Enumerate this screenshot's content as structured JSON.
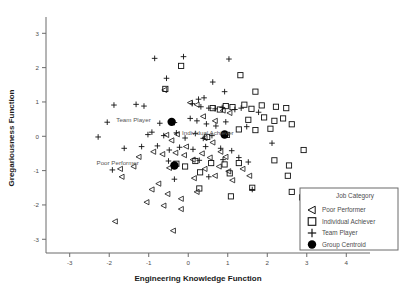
{
  "chart_data": {
    "type": "scatter",
    "title": "",
    "xlabel": "Engineering Knowledge Function",
    "ylabel": "Gregariousness Function",
    "xlim": [
      -3.6,
      4.6
    ],
    "ylim": [
      -3.4,
      3.3
    ],
    "xticks": [
      -3,
      -2,
      -1,
      0,
      1,
      2,
      3,
      4
    ],
    "yticks": [
      -3,
      -2,
      -1,
      0,
      1,
      2,
      3
    ],
    "grid": false,
    "legend": {
      "title": "Job Category",
      "position": "bottom-right",
      "entries": [
        {
          "label": "Poor Performer",
          "marker": "triangle-left"
        },
        {
          "label": "Individual Achiever",
          "marker": "square"
        },
        {
          "label": "Team Player",
          "marker": "plus"
        },
        {
          "label": "Group Centroid",
          "marker": "filled-circle"
        }
      ]
    },
    "annotations": [
      {
        "text": "Team Player",
        "x": -0.95,
        "y": 0.42
      },
      {
        "text": "Individual Achiever",
        "x": 1.15,
        "y": 0.05
      },
      {
        "text": "Poor Performer",
        "x": -1.25,
        "y": -0.85
      }
    ],
    "series": [
      {
        "name": "Team Player",
        "marker": "plus",
        "points": [
          [
            -0.85,
            2.27
          ],
          [
            -0.12,
            2.32
          ],
          [
            1.03,
            2.25
          ],
          [
            -0.55,
            1.69
          ],
          [
            0.62,
            1.58
          ],
          [
            0.92,
            1.3
          ],
          [
            -1.88,
            0.91
          ],
          [
            -1.32,
            0.93
          ],
          [
            -1.12,
            0.88
          ],
          [
            0.26,
            1.08
          ],
          [
            0.4,
            1.12
          ],
          [
            0.1,
            0.95
          ],
          [
            0.32,
            0.86
          ],
          [
            0.52,
            0.82
          ],
          [
            0.68,
            0.8
          ],
          [
            0.86,
            0.84
          ],
          [
            1.18,
            0.78
          ],
          [
            1.34,
            0.82
          ],
          [
            -2.05,
            0.41
          ],
          [
            -0.72,
            0.38
          ],
          [
            -0.35,
            0.4
          ],
          [
            0.05,
            0.52
          ],
          [
            0.22,
            0.45
          ],
          [
            0.46,
            0.36
          ],
          [
            0.7,
            0.3
          ],
          [
            0.95,
            0.42
          ],
          [
            -2.28,
            -0.02
          ],
          [
            -1.02,
            0.05
          ],
          [
            -0.92,
            0.12
          ],
          [
            -0.62,
            0.02
          ],
          [
            -0.3,
            0.1
          ],
          [
            -0.08,
            -0.05
          ],
          [
            0.18,
            0.08
          ],
          [
            0.38,
            -0.06
          ],
          [
            0.6,
            0.02
          ],
          [
            1.48,
            0.28
          ],
          [
            1.78,
            0.7
          ],
          [
            -1.62,
            -0.35
          ],
          [
            -1.18,
            -0.3
          ],
          [
            -0.78,
            -0.28
          ],
          [
            -0.48,
            -0.4
          ],
          [
            -0.22,
            -0.32
          ],
          [
            0.12,
            -0.38
          ],
          [
            0.44,
            -0.3
          ],
          [
            0.82,
            -0.35
          ],
          [
            1.1,
            -0.42
          ],
          [
            -1.92,
            -0.98
          ],
          [
            -0.5,
            -0.72
          ],
          [
            0.28,
            -0.7
          ],
          [
            0.88,
            -0.68
          ],
          [
            1.28,
            -0.62
          ],
          [
            -0.35,
            -1.25
          ],
          [
            0.52,
            -1.18
          ],
          [
            1.62,
            -1.55
          ],
          [
            2.12,
            -0.2
          ],
          [
            1.52,
            -0.75
          ]
        ]
      },
      {
        "name": "Individual Achiever",
        "marker": "square",
        "points": [
          [
            -0.18,
            2.05
          ],
          [
            1.32,
            1.78
          ],
          [
            1.7,
            1.3
          ],
          [
            0.95,
            0.88
          ],
          [
            1.12,
            0.85
          ],
          [
            1.42,
            0.92
          ],
          [
            1.6,
            0.8
          ],
          [
            1.86,
            0.9
          ],
          [
            2.22,
            0.86
          ],
          [
            0.62,
            0.82
          ],
          [
            0.8,
            0.78
          ],
          [
            2.48,
            0.82
          ],
          [
            1.52,
            0.48
          ],
          [
            1.92,
            0.55
          ],
          [
            2.4,
            0.52
          ],
          [
            1.28,
            0.2
          ],
          [
            1.7,
            0.18
          ],
          [
            2.08,
            0.22
          ],
          [
            0.98,
            0.04
          ],
          [
            2.62,
            0.35
          ],
          [
            2.18,
            0.45
          ],
          [
            -0.3,
            -0.8
          ],
          [
            -0.08,
            -0.88
          ],
          [
            0.18,
            -0.72
          ],
          [
            0.58,
            -0.78
          ],
          [
            0.92,
            -0.82
          ],
          [
            1.28,
            -0.78
          ],
          [
            2.18,
            -0.7
          ],
          [
            2.55,
            -0.85
          ],
          [
            0.3,
            -1.05
          ],
          [
            1.05,
            -1.08
          ],
          [
            0.28,
            -1.52
          ],
          [
            1.62,
            -1.5
          ],
          [
            2.62,
            -1.62
          ],
          [
            2.88,
            -1.78
          ],
          [
            -0.58,
            1.38
          ],
          [
            0.48,
            -0.02
          ],
          [
            1.08,
            -1.75
          ],
          [
            2.92,
            -0.4
          ],
          [
            2.52,
            -1.15
          ]
        ]
      },
      {
        "name": "Poor Performer",
        "marker": "triangle-left",
        "points": [
          [
            -0.6,
            1.35
          ],
          [
            0.05,
            0.98
          ],
          [
            0.22,
            0.92
          ],
          [
            0.88,
            0.75
          ],
          [
            1.05,
            0.68
          ],
          [
            -0.55,
            0.04
          ],
          [
            -0.42,
            -0.12
          ],
          [
            -0.28,
            0.06
          ],
          [
            0.42,
            -0.05
          ],
          [
            0.62,
            -0.18
          ],
          [
            -0.88,
            -0.45
          ],
          [
            -0.65,
            -0.52
          ],
          [
            -0.32,
            -0.48
          ],
          [
            -0.1,
            -0.55
          ],
          [
            0.35,
            -0.5
          ],
          [
            0.55,
            -0.62
          ],
          [
            0.82,
            -0.45
          ],
          [
            -1.72,
            -0.95
          ],
          [
            -1.38,
            -0.88
          ],
          [
            -0.48,
            -0.92
          ],
          [
            0.42,
            -0.95
          ],
          [
            0.78,
            -0.88
          ],
          [
            1.02,
            -1.02
          ],
          [
            -1.68,
            -1.18
          ],
          [
            0.15,
            -1.22
          ],
          [
            0.68,
            -1.15
          ],
          [
            1.12,
            -1.28
          ],
          [
            1.55,
            -1.15
          ],
          [
            -0.92,
            -1.55
          ],
          [
            -0.52,
            -1.68
          ],
          [
            -0.18,
            -1.82
          ],
          [
            -1.05,
            -1.92
          ],
          [
            -0.62,
            -2.02
          ],
          [
            -0.18,
            -2.12
          ],
          [
            -1.85,
            -2.48
          ],
          [
            -0.38,
            -2.75
          ],
          [
            0.38,
            0.58
          ],
          [
            0.68,
            0.45
          ],
          [
            -0.75,
            -1.38
          ],
          [
            0.95,
            -0.6
          ],
          [
            1.38,
            -0.95
          ],
          [
            -0.05,
            -0.3
          ],
          [
            0.12,
            -0.68
          ],
          [
            -1.25,
            -0.6
          ],
          [
            0.22,
            -1.62
          ]
        ]
      },
      {
        "name": "Group Centroid",
        "marker": "filled-circle",
        "points": [
          [
            -0.42,
            0.42
          ],
          [
            0.92,
            0.05
          ],
          [
            -0.35,
            -0.85
          ]
        ]
      }
    ]
  }
}
